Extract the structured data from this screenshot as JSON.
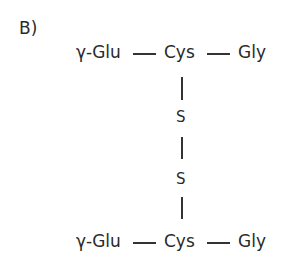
{
  "panel_label": "B)",
  "top_chain": {
    "left": "γ-Glu",
    "center": "Cys",
    "right": "Gly"
  },
  "bridge": {
    "atom1": "S",
    "atom2": "S"
  },
  "bottom_chain": {
    "left": "γ-Glu",
    "center": "Cys",
    "right": "Gly"
  }
}
